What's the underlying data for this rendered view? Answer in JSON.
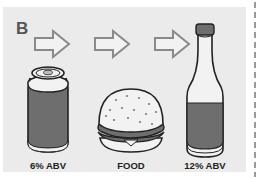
{
  "panel": {
    "letter": "B",
    "background": "#ebebeb",
    "sequence": [
      {
        "item": "can",
        "icon": "beer-can-icon",
        "label": "6% ABV"
      },
      {
        "item": "burger",
        "icon": "hamburger-icon",
        "label": "FOOD"
      },
      {
        "item": "bottle",
        "icon": "beer-bottle-icon",
        "label": "12% ABV"
      }
    ],
    "arrows": [
      "arrow-right-icon",
      "arrow-right-icon",
      "arrow-right-icon"
    ]
  },
  "colors": {
    "liquid": "#6e6e6e",
    "outline": "#222222",
    "light": "#f2f2f2",
    "arrow_stroke": "#8a8a8a"
  }
}
